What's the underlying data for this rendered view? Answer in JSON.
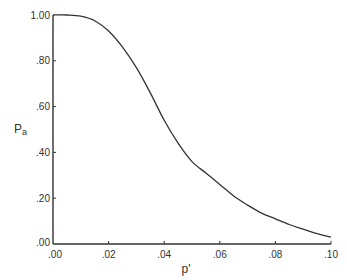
{
  "chart_data": {
    "type": "line",
    "title": "",
    "xlabel": "p'",
    "ylabel": "Pa",
    "xlim": [
      0.0,
      0.1
    ],
    "ylim": [
      0.0,
      1.0
    ],
    "grid": false,
    "legend": null,
    "x_ticks": [
      ".00",
      ".02",
      ".04",
      ".06",
      ".08",
      ".10"
    ],
    "y_ticks": [
      ".00",
      ".20",
      ".40",
      ".60",
      ".80",
      "1.00"
    ],
    "series": [
      {
        "name": "OC curve",
        "x": [
          0.0,
          0.005,
          0.01,
          0.015,
          0.02,
          0.025,
          0.03,
          0.035,
          0.04,
          0.045,
          0.05,
          0.055,
          0.06,
          0.065,
          0.07,
          0.075,
          0.08,
          0.085,
          0.09,
          0.095,
          0.1
        ],
        "y": [
          1.0,
          1.0,
          0.995,
          0.975,
          0.93,
          0.86,
          0.77,
          0.66,
          0.54,
          0.44,
          0.36,
          0.31,
          0.26,
          0.21,
          0.17,
          0.135,
          0.11,
          0.085,
          0.065,
          0.045,
          0.03
        ]
      }
    ]
  },
  "axes": {
    "x_label": "p'",
    "y_label_main": "P",
    "y_label_sub": "a"
  }
}
